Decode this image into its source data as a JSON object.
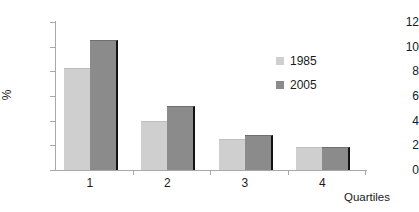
{
  "chart_data": {
    "type": "bar",
    "title": "",
    "xlabel": "Quartiles",
    "ylabel": "%",
    "categories": [
      "1",
      "2",
      "3",
      "4"
    ],
    "series": [
      {
        "name": "1985",
        "color": "#cfcfcf",
        "values": [
          8.2,
          3.9,
          2.4,
          1.8
        ]
      },
      {
        "name": "2005",
        "color": "#8b8b8b",
        "values": [
          10.5,
          5.1,
          2.75,
          1.8
        ]
      }
    ],
    "ylim": [
      0,
      12
    ],
    "yticks": [
      0,
      2,
      4,
      6,
      8,
      10,
      12
    ],
    "ytick_labels": [
      "0",
      "2",
      "4",
      "6",
      "8",
      "10",
      "12"
    ],
    "grid": false,
    "legend_position": "upper-right-inside"
  }
}
